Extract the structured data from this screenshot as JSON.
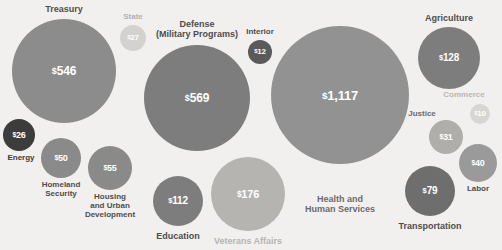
{
  "chart_data": {
    "type": "bubble",
    "title": "",
    "subtitle": "",
    "xlabel": "",
    "ylabel": "",
    "unit": "$ billions",
    "currency_symbol": "$",
    "background_color": "#f2f0ee",
    "legend": "none",
    "grid": false,
    "categories": [
      "Treasury",
      "State",
      "Defense (Military Programs)",
      "Interior",
      "Health and Human Services",
      "Agriculture",
      "Commerce",
      "Justice",
      "Labor",
      "Energy",
      "Homeland Security",
      "Housing and Urban Development",
      "Education",
      "Veterans Affairs",
      "Transportation"
    ],
    "values": [
      546,
      27,
      569,
      12,
      1117,
      128,
      10,
      31,
      40,
      26,
      50,
      55,
      112,
      176,
      79
    ],
    "bubbles": [
      {
        "id": "treasury",
        "label": "Treasury",
        "label_line2": "",
        "value": 546,
        "value_text": "546",
        "cx": 64,
        "cy": 71,
        "r": 52,
        "fill": "#8c8c8c",
        "value_color": "#ffffff",
        "value_size": 12,
        "label_color": "#4d4d4d",
        "label_size": 9,
        "label_x": 64,
        "label_y": 4,
        "label_position": "top"
      },
      {
        "id": "state",
        "label": "State",
        "label_line2": "",
        "value": 27,
        "value_text": "27",
        "cx": 133,
        "cy": 38,
        "r": 13,
        "fill": "#d4d2cf",
        "value_color": "#ffffff",
        "value_size": 8,
        "label_color": "#b3b0ac",
        "label_size": 8,
        "label_x": 133,
        "label_y": 13,
        "label_position": "top"
      },
      {
        "id": "defense",
        "label": "Defense",
        "label_line2": "(Military Programs)",
        "value": 569,
        "value_text": "569",
        "cx": 197,
        "cy": 98,
        "r": 53,
        "fill": "#7d7d7d",
        "value_color": "#ffffff",
        "value_size": 12,
        "label_color": "#4d4d4d",
        "label_size": 9,
        "label_x": 197,
        "label_y": 19,
        "label_position": "top"
      },
      {
        "id": "interior",
        "label": "Interior",
        "label_line2": "",
        "value": 12,
        "value_text": "12",
        "cx": 260,
        "cy": 52,
        "r": 12,
        "fill": "#5a5a5a",
        "value_color": "#ffffff",
        "value_size": 8,
        "label_color": "#4d4d4d",
        "label_size": 8,
        "label_x": 260,
        "label_y": 28,
        "label_position": "top"
      },
      {
        "id": "hhs",
        "label": "Health and",
        "label_line2": "Human Services",
        "value": 1117,
        "value_text": "1,117",
        "cx": 340,
        "cy": 95,
        "r": 69,
        "fill": "#929292",
        "value_color": "#ffffff",
        "value_size": 13,
        "label_color": "#6b6b6b",
        "label_size": 9,
        "label_x": 340,
        "label_y": 194,
        "label_position": "bottom"
      },
      {
        "id": "agriculture",
        "label": "Agriculture",
        "label_line2": "",
        "value": 128,
        "value_text": "128",
        "cx": 449,
        "cy": 58,
        "r": 31,
        "fill": "#7d7d7d",
        "value_color": "#ffffff",
        "value_size": 10,
        "label_color": "#4d4d4d",
        "label_size": 9,
        "label_x": 449,
        "label_y": 13,
        "label_position": "top"
      },
      {
        "id": "commerce",
        "label": "Commerce",
        "label_line2": "",
        "value": 10,
        "value_text": "10",
        "cx": 480,
        "cy": 114,
        "r": 10,
        "fill": "#d8d6d3",
        "value_color": "#ffffff",
        "value_size": 8,
        "label_color": "#bab7b3",
        "label_size": 8,
        "label_x": 464,
        "label_y": 91,
        "label_position": "top"
      },
      {
        "id": "justice",
        "label": "Justice",
        "label_line2": "",
        "value": 31,
        "value_text": "31",
        "cx": 446,
        "cy": 137,
        "r": 17,
        "fill": "#b0aeab",
        "value_color": "#ffffff",
        "value_size": 9,
        "label_color": "#6b6b6b",
        "label_size": 8,
        "label_x": 422,
        "label_y": 110,
        "label_position": "left"
      },
      {
        "id": "labor",
        "label": "Labor",
        "label_line2": "",
        "value": 40,
        "value_text": "40",
        "cx": 478,
        "cy": 163,
        "r": 19,
        "fill": "#9a9a9a",
        "value_color": "#ffffff",
        "value_size": 9,
        "label_color": "#4d4d4d",
        "label_size": 8,
        "label_x": 478,
        "label_y": 185,
        "label_position": "bottom"
      },
      {
        "id": "energy",
        "label": "Energy",
        "label_line2": "",
        "value": 26,
        "value_text": "26",
        "cx": 19,
        "cy": 135,
        "r": 16,
        "fill": "#3c3c3c",
        "value_color": "#ffffff",
        "value_size": 9,
        "label_color": "#3c3c3c",
        "label_size": 8,
        "label_x": 21,
        "label_y": 154,
        "label_position": "bottom"
      },
      {
        "id": "homeland-security",
        "label": "Homeland",
        "label_line2": "Security",
        "value": 50,
        "value_text": "50",
        "cx": 61,
        "cy": 158,
        "r": 20,
        "fill": "#8a8a8a",
        "value_color": "#ffffff",
        "value_size": 9,
        "label_color": "#4d4d4d",
        "label_size": 8,
        "label_x": 61,
        "label_y": 181,
        "label_position": "bottom"
      },
      {
        "id": "hud",
        "label": "Housing",
        "label_line2": "and Urban\nDevelopment",
        "value": 55,
        "value_text": "55",
        "cx": 110,
        "cy": 168,
        "r": 22,
        "fill": "#8a8a8a",
        "value_color": "#ffffff",
        "value_size": 9,
        "label_color": "#4d4d4d",
        "label_size": 8,
        "label_x": 110,
        "label_y": 193,
        "label_position": "bottom"
      },
      {
        "id": "education",
        "label": "Education",
        "label_line2": "",
        "value": 112,
        "value_text": "112",
        "cx": 178,
        "cy": 201,
        "r": 25,
        "fill": "#7d7d7d",
        "value_color": "#ffffff",
        "value_size": 10,
        "label_color": "#4d4d4d",
        "label_size": 9,
        "label_x": 178,
        "label_y": 231,
        "label_position": "bottom"
      },
      {
        "id": "veterans-affairs",
        "label": "Veterans Affairs",
        "label_line2": "",
        "value": 176,
        "value_text": "176",
        "cx": 248,
        "cy": 194,
        "r": 37,
        "fill": "#b6b4b1",
        "value_color": "#ffffff",
        "value_size": 11,
        "label_color": "#b6b4b1",
        "label_size": 9,
        "label_x": 248,
        "label_y": 236,
        "label_position": "bottom"
      },
      {
        "id": "transportation",
        "label": "Transportation",
        "label_line2": "",
        "value": 79,
        "value_text": "79",
        "cx": 430,
        "cy": 191,
        "r": 25,
        "fill": "#6e6e6e",
        "value_color": "#ffffff",
        "value_size": 10,
        "label_color": "#4d4d4d",
        "label_size": 9,
        "label_x": 430,
        "label_y": 221,
        "label_position": "bottom"
      }
    ]
  }
}
